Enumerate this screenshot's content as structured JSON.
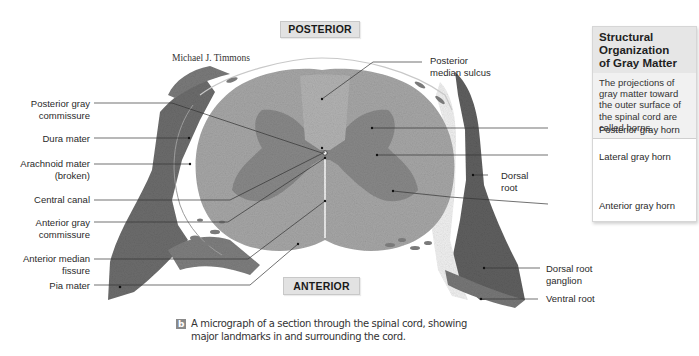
{
  "figure": {
    "credit": "Michael J. Timmons",
    "orientation": {
      "top": "POSTERIOR",
      "bottom": "ANTERIOR"
    },
    "left_labels": [
      {
        "id": "posterior-gray-commissure",
        "line1": "Posterior gray",
        "line2": "commissure"
      },
      {
        "id": "dura-mater",
        "line1": "Dura mater",
        "line2": ""
      },
      {
        "id": "arachnoid-mater",
        "line1": "Arachnoid mater",
        "line2": "(broken)"
      },
      {
        "id": "central-canal",
        "line1": "Central canal",
        "line2": ""
      },
      {
        "id": "anterior-gray-commissure",
        "line1": "Anterior gray",
        "line2": "commissure"
      },
      {
        "id": "anterior-median-fissure",
        "line1": "Anterior median",
        "line2": "fissure"
      },
      {
        "id": "pia-mater",
        "line1": "Pia mater",
        "line2": ""
      }
    ],
    "right_labels": [
      {
        "id": "posterior-median-sulcus",
        "line1": "Posterior",
        "line2": "median sulcus"
      },
      {
        "id": "dorsal-root",
        "line1": "Dorsal",
        "line2": "root"
      },
      {
        "id": "dorsal-root-ganglion",
        "line1": "Dorsal root",
        "line2": "ganglion"
      },
      {
        "id": "ventral-root",
        "line1": "Ventral root",
        "line2": ""
      }
    ]
  },
  "infobox": {
    "title_line1": "Structural Organization",
    "title_line2": "of Gray Matter",
    "description": "The projections of gray matter toward the outer surface of the spinal cord are called horns.",
    "items": [
      "Posterior gray horn",
      "Lateral gray horn",
      "Anterior gray horn"
    ]
  },
  "caption": {
    "badge": "b",
    "line1": "A micrograph of a section through the spinal cord, showing",
    "line2": "major landmarks in and surrounding the cord."
  },
  "colors": {
    "white_matter": "#a9a9a9",
    "gray_matter": "#8a8a8a",
    "root_tissue": "#6f6f6f",
    "label_box": "#e2e2e2"
  }
}
